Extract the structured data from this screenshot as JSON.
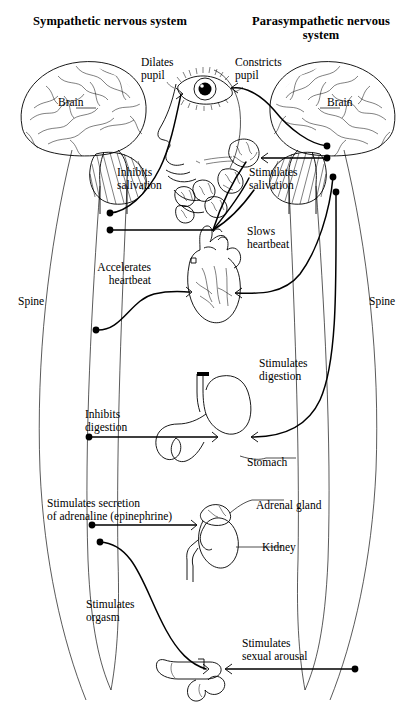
{
  "figure": {
    "ink_color": "#000000",
    "background_color": "#ffffff"
  },
  "headings": {
    "left": "Sympathetic\nnervous system",
    "right": "Parasympathetic\nnervous system"
  },
  "anatomy_labels": {
    "brain_left": "Brain",
    "brain_right": "Brain",
    "spine_left": "Spine",
    "spine_right": "Spine",
    "stomach": "Stomach",
    "adrenal_gland": "Adrenal gland",
    "kidney": "Kidney"
  },
  "sympathetic_actions": [
    {
      "id": "dilates-pupil",
      "text": "Dilates\npupil"
    },
    {
      "id": "inhibits-salivation",
      "text": "Inhibits\nsalivation"
    },
    {
      "id": "accelerates-heartbeat",
      "text": "Accelerates\nheartbeat"
    },
    {
      "id": "inhibits-digestion",
      "text": "Inhibits\ndigestion"
    },
    {
      "id": "stimulates-adrenaline",
      "text": "Stimulates secretion\nof adrenaline (epinephrine)"
    },
    {
      "id": "stimulates-orgasm",
      "text": "Stimulates\norgasm"
    }
  ],
  "parasympathetic_actions": [
    {
      "id": "constricts-pupil",
      "text": "Constricts\npupil"
    },
    {
      "id": "stimulates-salivation",
      "text": "Stimulates\nsalivation"
    },
    {
      "id": "slows-heartbeat",
      "text": "Slows\nheartbeat"
    },
    {
      "id": "stimulates-digestion",
      "text": "Stimulates\ndigestion"
    },
    {
      "id": "stimulates-sexual-arousal",
      "text": "Stimulates\nsexual arousal"
    }
  ],
  "organs": [
    {
      "id": "eye",
      "name": "eye"
    },
    {
      "id": "face",
      "name": "face-profile"
    },
    {
      "id": "salivary",
      "name": "salivary-glands"
    },
    {
      "id": "heart",
      "name": "heart"
    },
    {
      "id": "stomach",
      "name": "stomach"
    },
    {
      "id": "kidney",
      "name": "kidney-and-adrenal-gland"
    },
    {
      "id": "genitals",
      "name": "genitals"
    }
  ]
}
